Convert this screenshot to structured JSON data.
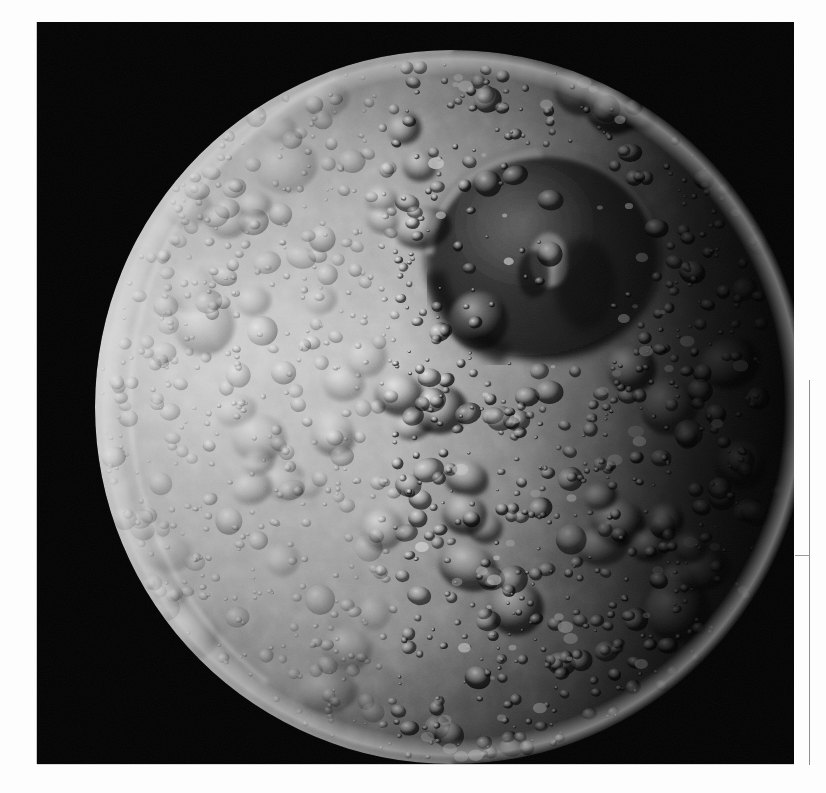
{
  "page": {
    "background_color": "#ffffff",
    "kind": "photographic-plate-scan"
  },
  "plate": {
    "background_color": "#020202",
    "x": 37,
    "y": 22,
    "width": 757,
    "height": 742,
    "caption": ""
  },
  "subject": {
    "name": "Mimas",
    "type": "moon",
    "illumination": "crescent-to-gibbous, sunlit from the left, terminator running top-right to bottom-right",
    "surface": "heavily cratered icy regolith",
    "feature": "Herschel crater",
    "colors": {
      "sunlit_highland": "#b9b9b9",
      "midtone_terrain": "#8e8e8e",
      "shadowed_terrain": "#3a3a3a",
      "terminator_dark": "#0b0b0b",
      "crater_highlight": "#d9d9d9",
      "crater_shadow": "#1a1a1a",
      "space": "#020202"
    },
    "disk": {
      "center_x": 415,
      "center_y": 385,
      "radius": 357
    }
  },
  "artifacts": {
    "right_rule": {
      "name": "vertical page rule",
      "color": "#8d8d8d",
      "x": 809,
      "y_top": 380,
      "y_bottom": 765
    },
    "right_tick": {
      "name": "horizontal tick mark",
      "color": "#9a9a9a",
      "y": 555,
      "x_left": 795,
      "x_right": 810
    }
  },
  "chart_data": {
    "type": "scatter"
  }
}
